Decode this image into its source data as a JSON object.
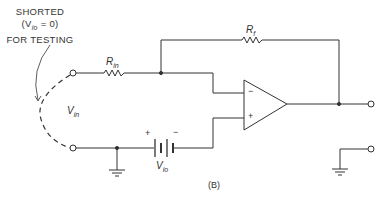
{
  "annotation": {
    "line1": "SHORTED",
    "line2_open": "(V",
    "line2_sub": "io",
    "line2_close": " = 0)",
    "line3": "FOR TESTING"
  },
  "labels": {
    "rin_main": "R",
    "rin_sub": "in",
    "rf_main": "R",
    "rf_sub": "f",
    "vin_main": "V",
    "vin_sub": "in",
    "vio_main": "V",
    "vio_sub": "io",
    "battery_plus": "+",
    "battery_minus": "−",
    "opamp_minus": "−",
    "opamp_plus": "+",
    "figure_caption": "(B)"
  },
  "colors": {
    "line": "#333333",
    "background": "#ffffff"
  }
}
